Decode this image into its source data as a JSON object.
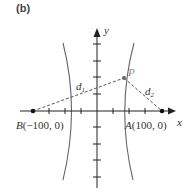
{
  "panel": {
    "label": "(b)"
  },
  "axes": {
    "x_label": "x",
    "y_label": "y",
    "x_ticks_px": [
      49,
      65,
      81,
      113,
      129,
      145
    ],
    "y_ticks_px": [
      44,
      61,
      77,
      94,
      127,
      144,
      160,
      177
    ]
  },
  "points": {
    "A": {
      "name": "A",
      "coords": "(100, 0)"
    },
    "B": {
      "name": "B",
      "coords": "(−100, 0)"
    },
    "P": {
      "name": "P"
    }
  },
  "distances": {
    "d1": {
      "base": "d",
      "sub": "1"
    },
    "d2": {
      "base": "d",
      "sub": "2"
    }
  },
  "colors": {
    "axis": "#222222",
    "curve": "#666666",
    "dashed": "#555555",
    "point_label_P": "#888888"
  }
}
